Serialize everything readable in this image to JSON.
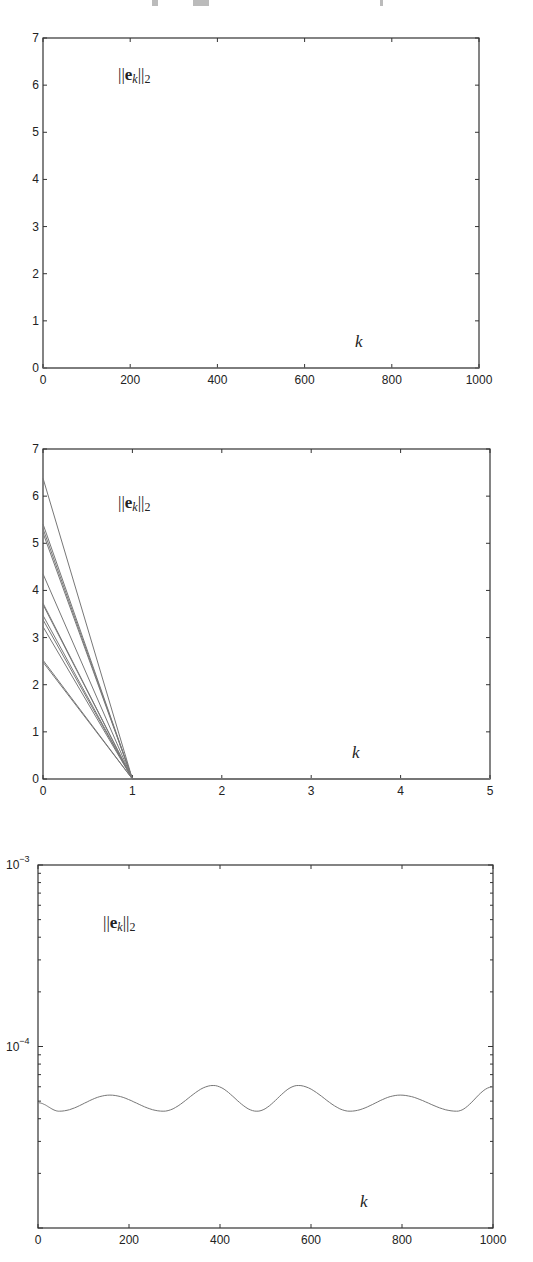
{
  "chart_data": [
    {
      "type": "line",
      "title": "",
      "annotation": "||e_k||_2",
      "annotation_parts": {
        "open": "||",
        "bold": "e",
        "sub": "k",
        "close": "||",
        "subscript2": "2"
      },
      "xlabel": "k",
      "ylabel": "",
      "xlim": [
        0,
        1000
      ],
      "ylim": [
        0,
        7
      ],
      "yscale": "linear",
      "grid": false,
      "x_ticks": [
        "0",
        "200",
        "400",
        "600",
        "800",
        "1000"
      ],
      "y_ticks": [
        "0",
        "1",
        "2",
        "3",
        "4",
        "5",
        "6",
        "7"
      ],
      "series": [
        {
          "name": "error norm",
          "x": [
            0,
            1000
          ],
          "values": [
            0,
            0
          ]
        }
      ]
    },
    {
      "type": "line",
      "title": "",
      "annotation": "||e_k||_2",
      "annotation_parts": {
        "open": "||",
        "bold": "e",
        "sub": "k",
        "close": "||",
        "subscript2": "2"
      },
      "xlabel": "k",
      "ylabel": "",
      "xlim": [
        0,
        5
      ],
      "ylim": [
        0,
        7
      ],
      "yscale": "linear",
      "grid": false,
      "x_ticks": [
        "0",
        "1",
        "2",
        "3",
        "4",
        "5"
      ],
      "y_ticks": [
        "0",
        "1",
        "2",
        "3",
        "4",
        "5",
        "6",
        "7"
      ],
      "x": [
        0,
        1,
        2,
        3,
        4,
        5
      ],
      "series": [
        {
          "name": "run 1",
          "values": [
            6.38,
            0,
            0,
            0,
            0,
            0
          ]
        },
        {
          "name": "run 2",
          "values": [
            5.41,
            0,
            0,
            0,
            0,
            0
          ]
        },
        {
          "name": "run 3",
          "values": [
            5.31,
            0,
            0,
            0,
            0,
            0
          ]
        },
        {
          "name": "run 4",
          "values": [
            5.22,
            0,
            0,
            0,
            0,
            0
          ]
        },
        {
          "name": "run 5",
          "values": [
            4.35,
            0,
            0,
            0,
            0,
            0
          ]
        },
        {
          "name": "run 6",
          "values": [
            3.73,
            0,
            0,
            0,
            0,
            0
          ]
        },
        {
          "name": "run 7",
          "values": [
            3.7,
            0,
            0,
            0,
            0,
            0
          ]
        },
        {
          "name": "run 8",
          "values": [
            3.47,
            0,
            0,
            0,
            0,
            0
          ]
        },
        {
          "name": "run 9",
          "values": [
            3.38,
            0,
            0,
            0,
            0,
            0
          ]
        },
        {
          "name": "run 10",
          "values": [
            3.23,
            0,
            0,
            0,
            0,
            0
          ]
        },
        {
          "name": "run 11",
          "values": [
            2.52,
            0,
            0,
            0,
            0,
            0
          ]
        },
        {
          "name": "run 12",
          "values": [
            2.48,
            0,
            0,
            0,
            0,
            0
          ]
        }
      ]
    },
    {
      "type": "line",
      "title": "",
      "annotation": "||e_k||_2",
      "annotation_parts": {
        "open": "||",
        "bold": "e",
        "sub": "k",
        "close": "||",
        "subscript2": "2"
      },
      "xlabel": "k",
      "ylabel": "",
      "xlim": [
        0,
        1000
      ],
      "ylim": [
        1e-05,
        0.001
      ],
      "yscale": "log",
      "grid": false,
      "x_ticks": [
        "0",
        "200",
        "400",
        "600",
        "800",
        "1000"
      ],
      "y_tick_labels": [
        {
          "base": "10",
          "exp": "−3",
          "value": 0.001
        },
        {
          "base": "10",
          "exp": "−4",
          "value": 0.0001
        }
      ],
      "series": [
        {
          "name": "error norm",
          "x": [
            0,
            47,
            158,
            275,
            385,
            481,
            572,
            686,
            796,
            920,
            1000
          ],
          "values": [
            4.9e-05,
            4.4e-05,
            5.4e-05,
            4.4e-05,
            6.1e-05,
            4.4e-05,
            6.1e-05,
            4.4e-05,
            5.4e-05,
            4.4e-05,
            6e-05
          ]
        }
      ]
    }
  ],
  "layout": {
    "charts": [
      {
        "left": 43,
        "right": 479,
        "top": 38,
        "bottom": 368,
        "annot_x": 118,
        "annot_y": 80,
        "klabel_x": 355,
        "klabel_y": 347
      },
      {
        "left": 43,
        "right": 490,
        "top": 449,
        "bottom": 779,
        "annot_x": 118,
        "annot_y": 508,
        "klabel_x": 352,
        "klabel_y": 758
      },
      {
        "left": 38,
        "right": 493,
        "top": 865,
        "bottom": 1228,
        "annot_x": 103,
        "annot_y": 928,
        "klabel_x": 360,
        "klabel_y": 1207
      }
    ],
    "line_color": "#777777",
    "axis_color": "#333333"
  }
}
